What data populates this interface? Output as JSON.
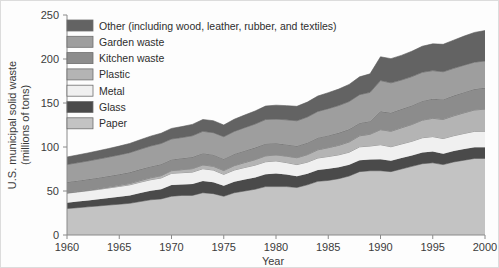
{
  "chart_data": {
    "type": "area",
    "stacked": true,
    "title": "",
    "xlabel": "Year",
    "ylabel": "U.S. municipal solid waste (millions of tons)",
    "xlim": [
      1960,
      2000
    ],
    "ylim": [
      0,
      250
    ],
    "xticks": [
      1960,
      1965,
      1970,
      1975,
      1980,
      1985,
      1990,
      1995,
      2000
    ],
    "yticks": [
      0,
      50,
      100,
      150,
      200,
      250
    ],
    "grid": false,
    "legend_position": "top-left",
    "x": [
      1960,
      1961,
      1962,
      1963,
      1964,
      1965,
      1966,
      1967,
      1968,
      1969,
      1970,
      1971,
      1972,
      1973,
      1974,
      1975,
      1976,
      1977,
      1978,
      1979,
      1980,
      1981,
      1982,
      1983,
      1984,
      1985,
      1986,
      1987,
      1988,
      1989,
      1990,
      1991,
      1992,
      1993,
      1994,
      1995,
      1996,
      1997,
      1998,
      1999,
      2000
    ],
    "series": [
      {
        "name": "Paper",
        "color": "#c3c3c3",
        "values": [
          30,
          31,
          32,
          33,
          34,
          35,
          36,
          38,
          40,
          41,
          44,
          45,
          45,
          48,
          47,
          44,
          48,
          50,
          52,
          55,
          55,
          55,
          54,
          57,
          61,
          62,
          64,
          67,
          72,
          73,
          73,
          72,
          75,
          78,
          81,
          82,
          80,
          83,
          85,
          87,
          87
        ]
      },
      {
        "name": "Glass",
        "color": "#4a4a4a",
        "values": [
          6.7,
          7,
          7.3,
          7.6,
          8,
          8.5,
          9,
          9.6,
          10.2,
          10.9,
          12.7,
          12.5,
          12.9,
          13.3,
          13,
          12,
          12.5,
          13,
          13.4,
          14,
          15,
          13.7,
          12.9,
          12.6,
          12.9,
          13.2,
          12.9,
          12.7,
          13,
          12.8,
          13.1,
          12.4,
          12.4,
          12.3,
          12.7,
          12.8,
          12.4,
          12.4,
          12.6,
          12.8,
          12.8
        ]
      },
      {
        "name": "Metal",
        "color": "#f0f0f0",
        "values": [
          10.8,
          10.9,
          11,
          11.2,
          11.5,
          11.7,
          12,
          12.4,
          12.6,
          12.9,
          13.4,
          13.3,
          13.6,
          14,
          13.8,
          12.9,
          13.3,
          13.7,
          14,
          14.2,
          14.2,
          13.6,
          13.1,
          13.2,
          13.6,
          14,
          14.2,
          14.4,
          15.2,
          15.3,
          16.5,
          15.9,
          16,
          16.2,
          16.8,
          17,
          17.2,
          17.4,
          17.8,
          18,
          18.1
        ]
      },
      {
        "name": "Plastic",
        "color": "#b4b4b4",
        "values": [
          0.4,
          0.5,
          0.6,
          0.8,
          1,
          1.2,
          1.5,
          1.8,
          2.2,
          2.6,
          3,
          3.4,
          3.9,
          4.3,
          4.3,
          4.4,
          5,
          5.6,
          6.2,
          6.7,
          6.8,
          7.3,
          7.8,
          8.5,
          9.3,
          10,
          10.8,
          11.6,
          12.5,
          13.4,
          17.1,
          17.6,
          18.4,
          19.1,
          20,
          20.8,
          21.8,
          22.6,
          23.5,
          24.3,
          25.1
        ]
      },
      {
        "name": "Kitchen waste",
        "color": "#8c8c8c",
        "values": [
          12.2,
          12.3,
          12.4,
          12.5,
          12.5,
          12.6,
          12.7,
          12.8,
          12.9,
          13,
          12.8,
          13,
          13.2,
          13.4,
          13.2,
          13.2,
          13.3,
          13.5,
          13.7,
          13.9,
          13.2,
          13.3,
          13.4,
          13.6,
          13.8,
          14,
          14.2,
          14.4,
          14.6,
          14.8,
          20.8,
          21,
          21.3,
          21.6,
          21.9,
          22.2,
          22.6,
          23,
          23.4,
          23.8,
          24.2
        ]
      },
      {
        "name": "Garden waste",
        "color": "#9e9e9e",
        "values": [
          20,
          20.4,
          20.8,
          21.2,
          21.6,
          22,
          22.4,
          22.8,
          23.2,
          23.6,
          23.2,
          23.6,
          24.2,
          24.8,
          25,
          25.2,
          25.6,
          26.2,
          26.8,
          27.4,
          27.5,
          28,
          28.6,
          29.2,
          29.8,
          30.4,
          31,
          31.6,
          32.2,
          32.8,
          35,
          34,
          33,
          32.8,
          32.5,
          32,
          31.5,
          31,
          30.7,
          30.5,
          30.5
        ]
      },
      {
        "name": "Other (including wood, leather, rubber, and textiles)",
        "color": "#636363",
        "values": [
          8.5,
          8.8,
          9.1,
          9.4,
          9.7,
          10,
          10.4,
          10.8,
          11.2,
          11.6,
          12,
          12.4,
          12.9,
          13.4,
          13.6,
          13.3,
          13.8,
          14.3,
          14.8,
          15.3,
          15.8,
          16.1,
          16.4,
          16.9,
          17.5,
          18.1,
          18.7,
          19.4,
          20.2,
          21,
          27,
          27.5,
          28,
          28.8,
          29.6,
          30.4,
          31.2,
          32,
          33,
          33.8,
          34.6
        ]
      }
    ],
    "legend_order": [
      "Other (including wood, leather, rubber, and textiles)",
      "Garden waste",
      "Kitchen waste",
      "Plastic",
      "Metal",
      "Glass",
      "Paper"
    ]
  }
}
